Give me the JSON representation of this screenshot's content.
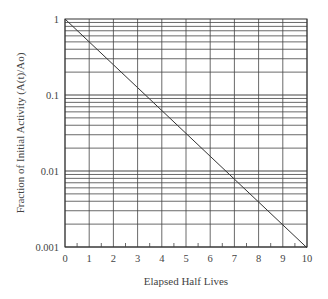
{
  "chart_data": {
    "type": "line",
    "title": "",
    "xlabel": "Elapsed Half Lives",
    "ylabel": "Fraction of Initial Activity (A(t)/Ao)",
    "xlim": [
      0,
      10
    ],
    "ylim": [
      0.001,
      1
    ],
    "yscale": "log",
    "grid": true,
    "x_ticks": [
      "0",
      "1",
      "2",
      "3",
      "4",
      "5",
      "6",
      "7",
      "8",
      "9",
      "10"
    ],
    "y_ticks": [
      "1",
      "0.1",
      "0.01",
      "0.001"
    ],
    "series": [
      {
        "name": "Decay",
        "x": [
          0,
          1,
          2,
          3,
          4,
          5,
          6,
          7,
          8,
          9,
          10
        ],
        "values": [
          1,
          0.5,
          0.25,
          0.125,
          0.0625,
          0.03125,
          0.015625,
          0.0078125,
          0.00390625,
          0.001953125,
          0.0009765625
        ]
      }
    ],
    "colors": {
      "line": "#333333",
      "grid": "#444444",
      "axis": "#333333"
    }
  }
}
